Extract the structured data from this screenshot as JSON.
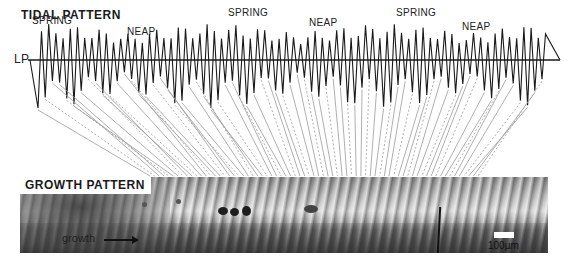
{
  "tidal": {
    "title": "TIDAL PATTERN",
    "baseline_label": "LP",
    "phase_labels": [
      {
        "text": "SPRING",
        "x": 32,
        "y": 25
      },
      {
        "text": "NEAP",
        "x": 127,
        "y": 36
      },
      {
        "text": "SPRING",
        "x": 228,
        "y": 17
      },
      {
        "text": "NEAP",
        "x": 309,
        "y": 27
      },
      {
        "text": "SPRING",
        "x": 396,
        "y": 17
      },
      {
        "text": "NEAP",
        "x": 462,
        "y": 31
      }
    ]
  },
  "growth": {
    "title": "GROWTH PATTERN",
    "direction_label": "growth",
    "scale_label": "100µm"
  },
  "colors": {
    "line": "#1a1a1a",
    "connector": "#9a9a9a",
    "background": "#ffffff"
  }
}
